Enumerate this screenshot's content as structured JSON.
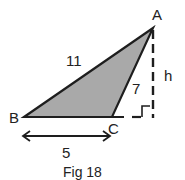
{
  "figure": {
    "caption": "Fig 18",
    "colors": {
      "fill": "#a9a9a9",
      "stroke": "#1e1e1e",
      "background": "#ffffff"
    },
    "vertices": {
      "A": "A",
      "B": "B",
      "C": "C"
    },
    "sides": {
      "AB": "11",
      "AC": "7",
      "BC": "5"
    },
    "height_label": "h",
    "right_angle_marker": true
  }
}
